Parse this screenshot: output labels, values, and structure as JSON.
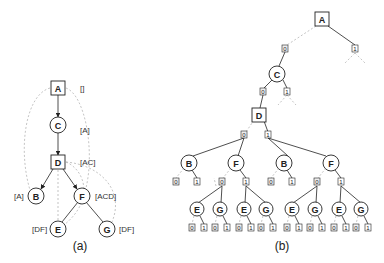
{
  "figure_a": {
    "caption": "(a)",
    "nodes": [
      {
        "id": "A",
        "label": "A",
        "shape": "box",
        "annotation": "[]"
      },
      {
        "id": "C",
        "label": "C",
        "shape": "circle",
        "annotation": "[A]"
      },
      {
        "id": "D",
        "label": "D",
        "shape": "box",
        "annotation": "[AC]"
      },
      {
        "id": "B",
        "label": "B",
        "shape": "circle",
        "annotation": "[A]"
      },
      {
        "id": "F",
        "label": "F",
        "shape": "circle",
        "annotation": "[ACD]"
      },
      {
        "id": "E",
        "label": "E",
        "shape": "circle",
        "annotation": "[DF]"
      },
      {
        "id": "G",
        "label": "G",
        "shape": "circle",
        "annotation": "[DF]"
      }
    ]
  },
  "figure_b": {
    "caption": "(b)",
    "root": "A",
    "level1": {
      "node": "C"
    },
    "level2": {
      "node": "D"
    },
    "level3": [
      "B",
      "F",
      "B",
      "F"
    ],
    "level4": [
      "E",
      "G",
      "E",
      "G",
      "E",
      "G",
      "E",
      "G"
    ],
    "bits": {
      "zero": "0",
      "one": "1"
    }
  }
}
